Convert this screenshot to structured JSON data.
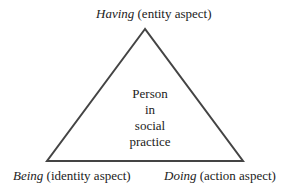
{
  "diagram": {
    "type": "triangle",
    "colors": {
      "line": "#444444",
      "text": "#222222",
      "background": "#ffffff"
    },
    "top": {
      "term": "Having",
      "aspect": "(entity aspect)"
    },
    "bottom_left": {
      "term": "Being",
      "aspect": "(identity aspect)"
    },
    "bottom_right": {
      "term": "Doing",
      "aspect": "(action aspect)"
    },
    "center_lines": [
      "Person",
      "in",
      "social",
      "practice"
    ]
  }
}
